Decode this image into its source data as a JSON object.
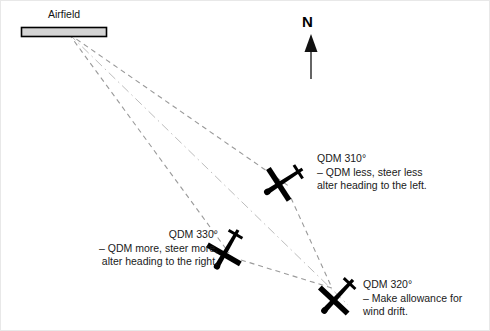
{
  "diagram": {
    "title_label": "Airfield",
    "north_label": "N",
    "colors": {
      "airfield_fill": "#d4d4d4",
      "airfield_stroke": "#000000",
      "dashed_line": "#9a9a9a",
      "dashdot_line": "#b8b8b8",
      "aircraft": "#000000",
      "text": "#141414",
      "background": "#ffffff",
      "border": "#e8e8e8"
    },
    "callouts": [
      {
        "name": "qdm-310",
        "heading": "QDM 310°",
        "line2": "– QDM less, steer less",
        "line3": "alter heading to the left."
      },
      {
        "name": "qdm-330",
        "heading": "QDM 330°",
        "line2": "– QDM more, steer more,",
        "line3": "alter heading to the right."
      },
      {
        "name": "qdm-320",
        "heading": "QDM 320°",
        "line2": "– Make allowance for",
        "line3": "wind drift."
      }
    ],
    "aircraft": [
      {
        "name": "aircraft-310",
        "x": 283,
        "y": 180,
        "rotation": 145
      },
      {
        "name": "aircraft-330",
        "x": 225,
        "y": 247,
        "rotation": 118
      },
      {
        "name": "aircraft-320",
        "x": 335,
        "y": 294,
        "rotation": 132
      }
    ],
    "airfield_rect": {
      "x": 20,
      "y": 26,
      "width": 86,
      "height": 10
    },
    "origin_point": {
      "x": 68,
      "y": 33
    },
    "convergence_point": {
      "x": 330,
      "y": 286
    },
    "bearing_lines": [
      {
        "name": "bearing-line-left",
        "style": "dashed",
        "to_x": 225,
        "to_y": 247
      },
      {
        "name": "bearing-line-center",
        "style": "dashdot",
        "to_x": 345,
        "to_y": 302
      },
      {
        "name": "bearing-line-right",
        "style": "dashed",
        "to_x": 283,
        "to_y": 180
      }
    ],
    "connector_lines": [
      {
        "name": "connector-310-to-320",
        "from_x": 288,
        "from_y": 196,
        "to_x": 330,
        "to_y": 286
      },
      {
        "name": "connector-330-to-320",
        "from_x": 238,
        "from_y": 258,
        "to_x": 330,
        "to_y": 286
      }
    ],
    "north_arrow": {
      "x": 310,
      "tail_y": 78,
      "head_y": 36
    }
  }
}
